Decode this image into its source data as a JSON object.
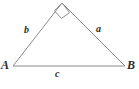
{
  "figure": {
    "type": "right-triangle-diagram",
    "background_color": "#ffffff",
    "stroke_color": "#8a8a8a",
    "text_color": "#2b2b2b",
    "stroke_width": 1,
    "canvas": {
      "width": 139,
      "height": 89
    },
    "vertices": [
      {
        "name": "A",
        "label": "A",
        "x": 13,
        "y": 66
      },
      {
        "name": "B",
        "label": "B",
        "x": 125,
        "y": 66
      },
      {
        "name": "C",
        "label": "",
        "x": 62,
        "y": 3
      }
    ],
    "sides": [
      {
        "name": "a",
        "label": "a",
        "from": "C",
        "to": "B",
        "label_x": 96,
        "label_y": 24
      },
      {
        "name": "b",
        "label": "b",
        "from": "A",
        "to": "C",
        "label_x": 24,
        "label_y": 25
      },
      {
        "name": "c",
        "label": "c",
        "from": "A",
        "to": "B",
        "label_x": 55,
        "label_y": 69
      }
    ],
    "right_angle": {
      "at_vertex": "C",
      "marker": "square",
      "size": 10,
      "description": "right-angle-square-marker"
    },
    "polygon_points": "13,66 62,3 125,66",
    "right_angle_points": "62,3 69.5,12.6 61.5,18.5 54.5,10.8"
  }
}
